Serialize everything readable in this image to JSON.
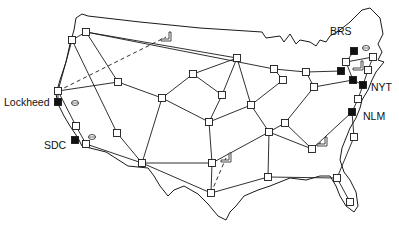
{
  "diagram": {
    "title": "",
    "type": "network map",
    "colors": {
      "line": "#1a1a1a",
      "host_fill": "#111111",
      "node_fill": "#ffffff",
      "background": "#ffffff"
    },
    "labels": [
      {
        "id": "brs",
        "text": "BRS",
        "x": 330,
        "y": 26
      },
      {
        "id": "nyt",
        "text": "NYT",
        "x": 371,
        "y": 82
      },
      {
        "id": "nlm",
        "text": "NLM",
        "x": 363,
        "y": 111
      },
      {
        "id": "lockheed",
        "text": "Lockheed",
        "x": 4,
        "y": 97
      },
      {
        "id": "sdc",
        "text": "SDC",
        "x": 44,
        "y": 140
      }
    ],
    "nodes": [
      {
        "id": "seattle",
        "x": 86,
        "y": 32,
        "kind": "switch"
      },
      {
        "id": "portland",
        "x": 72,
        "y": 40,
        "kind": "switch"
      },
      {
        "id": "sf",
        "x": 58,
        "y": 91,
        "kind": "switch"
      },
      {
        "id": "lockheed",
        "x": 58,
        "y": 102,
        "kind": "host"
      },
      {
        "id": "la",
        "x": 76,
        "y": 126,
        "kind": "switch"
      },
      {
        "id": "sdc",
        "x": 75,
        "y": 140,
        "kind": "host"
      },
      {
        "id": "sd",
        "x": 86,
        "y": 144,
        "kind": "switch"
      },
      {
        "id": "saltlake",
        "x": 118,
        "y": 82,
        "kind": "switch"
      },
      {
        "id": "lasvegas",
        "x": 117,
        "y": 133,
        "kind": "switch"
      },
      {
        "id": "phoenix",
        "x": 142,
        "y": 163,
        "kind": "switch"
      },
      {
        "id": "denver",
        "x": 162,
        "y": 98,
        "kind": "switch"
      },
      {
        "id": "nplatte",
        "x": 193,
        "y": 74,
        "kind": "switch"
      },
      {
        "id": "minneapolis",
        "x": 237,
        "y": 58,
        "kind": "switch"
      },
      {
        "id": "omaha",
        "x": 222,
        "y": 95,
        "kind": "switch"
      },
      {
        "id": "kc",
        "x": 209,
        "y": 122,
        "kind": "switch"
      },
      {
        "id": "dallas",
        "x": 212,
        "y": 163,
        "kind": "switch"
      },
      {
        "id": "houston",
        "x": 211,
        "y": 193,
        "kind": "switch"
      },
      {
        "id": "chicago",
        "x": 274,
        "y": 69,
        "kind": "switch"
      },
      {
        "id": "stlouis",
        "x": 251,
        "y": 105,
        "kind": "switch"
      },
      {
        "id": "memphis",
        "x": 269,
        "y": 132,
        "kind": "switch"
      },
      {
        "id": "nashville",
        "x": 285,
        "y": 123,
        "kind": "switch"
      },
      {
        "id": "atlanta",
        "x": 312,
        "y": 149,
        "kind": "switch"
      },
      {
        "id": "neworleans",
        "x": 268,
        "y": 177,
        "kind": "switch"
      },
      {
        "id": "jacksonville",
        "x": 337,
        "y": 178,
        "kind": "switch"
      },
      {
        "id": "miami",
        "x": 350,
        "y": 202,
        "kind": "switch"
      },
      {
        "id": "detroit",
        "x": 306,
        "y": 72,
        "kind": "switch"
      },
      {
        "id": "columbus",
        "x": 283,
        "y": 80,
        "kind": "switch"
      },
      {
        "id": "pittsburgh",
        "x": 314,
        "y": 87,
        "kind": "switch"
      },
      {
        "id": "cleveland_host",
        "x": 341,
        "y": 71,
        "kind": "host"
      },
      {
        "id": "brs_host",
        "x": 354,
        "y": 51,
        "kind": "host"
      },
      {
        "id": "albany",
        "x": 346,
        "y": 62,
        "kind": "switch"
      },
      {
        "id": "boston",
        "x": 373,
        "y": 57,
        "kind": "switch"
      },
      {
        "id": "hartford",
        "x": 368,
        "y": 70,
        "kind": "switch"
      },
      {
        "id": "nyt_host",
        "x": 363,
        "y": 85,
        "kind": "host"
      },
      {
        "id": "ny_host",
        "x": 353,
        "y": 80,
        "kind": "host"
      },
      {
        "id": "philly",
        "x": 358,
        "y": 99,
        "kind": "switch"
      },
      {
        "id": "nlm_host",
        "x": 352,
        "y": 112,
        "kind": "host"
      },
      {
        "id": "dc",
        "x": 354,
        "y": 137,
        "kind": "switch"
      }
    ],
    "links": [
      [
        "seattle",
        "portland"
      ],
      [
        "seattle",
        "saltlake"
      ],
      [
        "seattle",
        "minneapolis"
      ],
      [
        "seattle",
        "chicago"
      ],
      [
        "portland",
        "sf"
      ],
      [
        "portland",
        "lasvegas"
      ],
      [
        "sf",
        "saltlake"
      ],
      [
        "sf",
        "lockheed"
      ],
      [
        "sf",
        "la"
      ],
      [
        "la",
        "sd"
      ],
      [
        "sd",
        "phoenix"
      ],
      [
        "lasvegas",
        "phoenix"
      ],
      [
        "saltlake",
        "denver"
      ],
      [
        "denver",
        "phoenix"
      ],
      [
        "denver",
        "kc"
      ],
      [
        "denver",
        "nplatte"
      ],
      [
        "nplatte",
        "minneapolis"
      ],
      [
        "nplatte",
        "omaha"
      ],
      [
        "minneapolis",
        "omaha"
      ],
      [
        "minneapolis",
        "stlouis"
      ],
      [
        "omaha",
        "kc"
      ],
      [
        "kc",
        "dallas"
      ],
      [
        "kc",
        "stlouis"
      ],
      [
        "phoenix",
        "dallas"
      ],
      [
        "phoenix",
        "houston"
      ],
      [
        "dallas",
        "houston"
      ],
      [
        "dallas",
        "memphis"
      ],
      [
        "houston",
        "neworleans"
      ],
      [
        "stlouis",
        "columbus"
      ],
      [
        "stlouis",
        "memphis"
      ],
      [
        "memphis",
        "nashville"
      ],
      [
        "nashville",
        "pittsburgh"
      ],
      [
        "nashville",
        "atlanta"
      ],
      [
        "memphis",
        "atlanta"
      ],
      [
        "atlanta",
        "nlm_host"
      ],
      [
        "neworleans",
        "jacksonville"
      ],
      [
        "jacksonville",
        "dc"
      ],
      [
        "jacksonville",
        "miami"
      ],
      [
        "neworleans",
        "memphis"
      ],
      [
        "columbus",
        "chicago"
      ],
      [
        "chicago",
        "detroit"
      ],
      [
        "detroit",
        "cleveland_host"
      ],
      [
        "detroit",
        "pittsburgh"
      ],
      [
        "pittsburgh",
        "ny_host"
      ],
      [
        "ny_host",
        "nyt_host"
      ],
      [
        "ny_host",
        "albany"
      ],
      [
        "albany",
        "boston"
      ],
      [
        "albany",
        "brs_host"
      ],
      [
        "boston",
        "hartford"
      ],
      [
        "hartford",
        "nyt_host"
      ],
      [
        "nyt_host",
        "philly"
      ],
      [
        "philly",
        "nlm_host"
      ],
      [
        "nlm_host",
        "dc"
      ]
    ],
    "dashed_links": [
      [
        "sf",
        "satellite_nw"
      ],
      [
        "houston",
        "satellite_tx"
      ],
      [
        "atlanta",
        "satellite_se"
      ]
    ],
    "terminals": [
      {
        "id": "satellite_nw",
        "x": 166,
        "y": 37,
        "glyph": "terminal-icon"
      },
      {
        "id": "satellite_tx",
        "x": 226,
        "y": 158,
        "glyph": "terminal-icon"
      },
      {
        "id": "satellite_se",
        "x": 322,
        "y": 142,
        "glyph": "terminal-icon"
      },
      {
        "id": "satellite_ne",
        "x": 358,
        "y": 66,
        "glyph": "terminal-icon"
      },
      {
        "id": "disk_lockheed",
        "x": 75,
        "y": 103,
        "glyph": "disk-icon"
      },
      {
        "id": "disk_sdc",
        "x": 92,
        "y": 137,
        "glyph": "disk-icon"
      },
      {
        "id": "disk_brs",
        "x": 366,
        "y": 48,
        "glyph": "disk-icon"
      }
    ]
  }
}
